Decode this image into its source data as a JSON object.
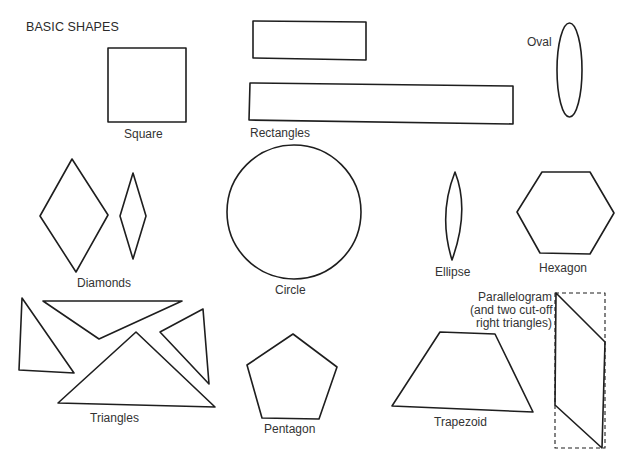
{
  "title": "BASIC SHAPES",
  "labels": {
    "square": "Square",
    "rectangles": "Rectangles",
    "oval": "Oval",
    "diamonds": "Diamonds",
    "circle": "Circle",
    "ellipse": "Ellipse",
    "hexagon": "Hexagon",
    "triangles": "Triangles",
    "pentagon": "Pentagon",
    "trapezoid": "Trapezoid",
    "parallelogram_line1": "Parallelogram",
    "parallelogram_line2": "(and two cut-off",
    "parallelogram_line3": "right triangles)"
  },
  "colors": {
    "stroke": "#1e1e1e",
    "background": "#ffffff"
  }
}
